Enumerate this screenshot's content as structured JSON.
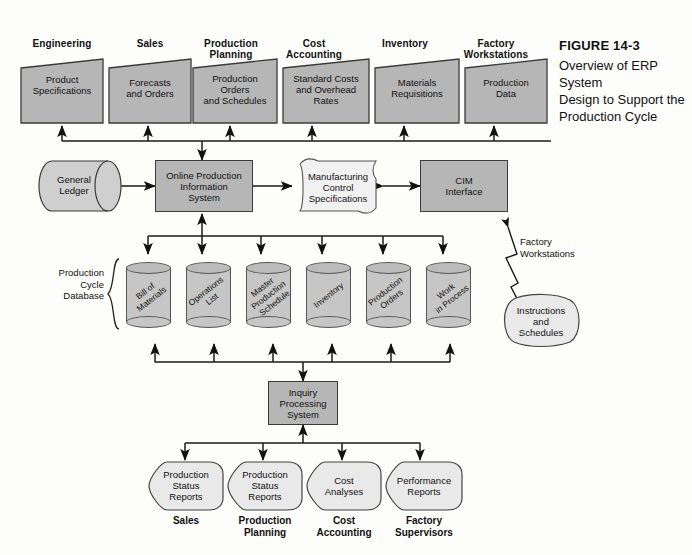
{
  "figure": {
    "number": "FIGURE 14-3",
    "caption_lines": [
      "Overview of ERP System",
      "Design to Support the",
      "Production Cycle"
    ]
  },
  "colors": {
    "shape_fill": "#b6b6b6",
    "cylinder_fill": "#c6c6c6",
    "cylinder_top": "#bcbcbc",
    "light_fill": "#e9e9e9",
    "stroke": "#3a3a3a",
    "page_bg": "#fdfdfb"
  },
  "top_row": {
    "headers": [
      "Engineering",
      "Sales",
      "Production\nPlanning",
      "Cost\nAccounting",
      "Inventory",
      "Factory\nWorkstations"
    ],
    "documents": [
      "Product\nSpecifications",
      "Forecasts\nand Orders",
      "Production\nOrders\nand Schedules",
      "Standard Costs\nand Overhead\nRates",
      "Materials\nRequisitions",
      "Production\nData"
    ]
  },
  "middle_row": {
    "general_ledger": "General\nLedger",
    "online_system": "Online Production\nInformation\nSystem",
    "manufacturing_spec": "Manufacturing\nControl\nSpecifications",
    "cim_interface": "CIM\nInterface"
  },
  "database": {
    "bracket_label": "Production\nCycle\nDatabase",
    "cylinders": [
      "Bill of\nMaterials",
      "Operations\nList",
      "Master\nProduction\nSchedule",
      "Inventory",
      "Production\nOrders",
      "Work\nin Process"
    ]
  },
  "factory": {
    "link_label": "Factory\nWorkstations",
    "instructions": "Instructions\nand\nSchedules"
  },
  "inquiry": {
    "label": "Inquiry\nProcessing\nSystem"
  },
  "outputs": {
    "reports": [
      "Production\nStatus\nReports",
      "Production\nStatus\nReports",
      "Cost\nAnalyses",
      "Performance\nReports"
    ],
    "recipients": [
      "Sales",
      "Production\nPlanning",
      "Cost\nAccounting",
      "Factory\nSupervisors"
    ]
  }
}
